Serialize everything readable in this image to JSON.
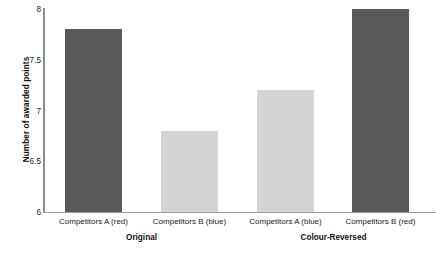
{
  "chart_data": {
    "type": "bar",
    "title": "",
    "xlabel": "",
    "ylabel": "Number of awarded points",
    "ylim": [
      6,
      8
    ],
    "yticks": [
      "6",
      "6.5",
      "7",
      "7.5",
      "8"
    ],
    "ytick_values": [
      6,
      6.5,
      7,
      7.5,
      8
    ],
    "grid": false,
    "legend": "none",
    "categories": [
      "Competitors A (red)",
      "Competitors B (blue)",
      "Competitors A (blue)",
      "Competitors B (red)"
    ],
    "values": [
      7.8,
      6.8,
      7.2,
      8.0
    ],
    "bar_colors": [
      "#595959",
      "#d4d4d4",
      "#d4d4d4",
      "#595959"
    ],
    "groups": [
      {
        "label": "Original",
        "categories": [
          "Competitors A (red)",
          "Competitors B (blue)"
        ],
        "values": [
          7.8,
          6.8
        ]
      },
      {
        "label": "Colour-Reversed",
        "categories": [
          "Competitors A (blue)",
          "Competitors B (red)"
        ],
        "values": [
          7.2,
          8.0
        ]
      }
    ],
    "colors": {
      "dark_bar": "#595959",
      "light_bar": "#d4d4d4",
      "axis": "#8c8c8c",
      "text": "#1b1b1b",
      "background": "#ffffff"
    }
  }
}
